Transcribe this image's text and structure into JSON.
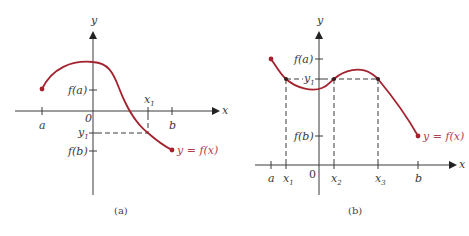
{
  "panels": [
    {
      "id": "a",
      "caption": "(a)",
      "axis_labels": {
        "x": "x",
        "y": "y",
        "origin": "0"
      },
      "x_ticks": [
        {
          "label": "a"
        },
        {
          "label": "b"
        },
        {
          "label": "x",
          "sub": "1"
        }
      ],
      "y_ticks": [
        {
          "label": "f(a)"
        },
        {
          "label": "y",
          "sub": "1"
        },
        {
          "label": "f(b)"
        }
      ],
      "curve_label": "y = f(x)"
    },
    {
      "id": "b",
      "caption": "(b)",
      "axis_labels": {
        "x": "x",
        "y": "y",
        "origin": "0"
      },
      "x_ticks": [
        {
          "label": "a"
        },
        {
          "label": "x",
          "sub": "1"
        },
        {
          "label": "x",
          "sub": "2"
        },
        {
          "label": "x",
          "sub": "3"
        },
        {
          "label": "b"
        }
      ],
      "y_ticks": [
        {
          "label": "f(a)"
        },
        {
          "label": "y",
          "sub": "1"
        },
        {
          "label": "f(b)"
        }
      ],
      "curve_label": "y = f(x)"
    }
  ],
  "colors": {
    "curve": "#a3222e",
    "curve_label": "#b04050",
    "axes": "#3a3a3a"
  }
}
